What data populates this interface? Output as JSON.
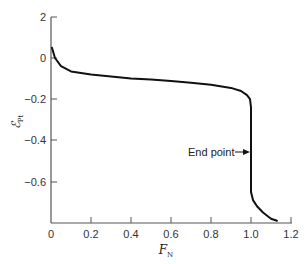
{
  "chart_data": {
    "type": "line",
    "title": "",
    "xlabel": "F_N",
    "ylabel": "ℰ_Pt",
    "xlabel_main": "F",
    "xlabel_sub": "N",
    "ylabel_main": "ℰ",
    "ylabel_sub": "Pt",
    "xlim": [
      0,
      1.2
    ],
    "ylim": [
      -0.8,
      0.2
    ],
    "x_ticks": [
      0,
      0.2,
      0.4,
      0.6,
      0.8,
      1.0,
      1.2
    ],
    "x_tick_labels": [
      "0",
      "0.2",
      "0.4",
      "0.6",
      "0.8",
      "1.0",
      "1.2"
    ],
    "y_ticks": [
      0.2,
      0,
      -0.2,
      -0.4,
      -0.6
    ],
    "y_tick_labels": [
      "2",
      "0",
      "−0.2",
      "−0.4",
      "−0.6"
    ],
    "grid": false,
    "legend": null,
    "series": [
      {
        "name": "Titration curve",
        "x": [
          0.005,
          0.02,
          0.05,
          0.1,
          0.2,
          0.3,
          0.4,
          0.5,
          0.6,
          0.7,
          0.8,
          0.9,
          0.95,
          0.98,
          0.995,
          1.0,
          1.0,
          1.0,
          1.0,
          1.01,
          1.03,
          1.06,
          1.1,
          1.13
        ],
        "y": [
          0.05,
          0.0,
          -0.04,
          -0.065,
          -0.08,
          -0.09,
          -0.1,
          -0.105,
          -0.112,
          -0.12,
          -0.13,
          -0.145,
          -0.16,
          -0.18,
          -0.2,
          -0.24,
          -0.4,
          -0.55,
          -0.65,
          -0.69,
          -0.72,
          -0.75,
          -0.78,
          -0.79
        ]
      }
    ],
    "annotations": [
      {
        "text": "End point",
        "arrow_to": {
          "x": 1.0,
          "y": -0.34
        }
      }
    ]
  },
  "labels": {
    "annotation_end_point": "End point"
  }
}
